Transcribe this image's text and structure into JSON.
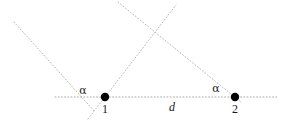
{
  "figure": {
    "canvas": {
      "width": 291,
      "height": 128,
      "background": "#ffffff"
    },
    "style": {
      "dotted_line_color": "#b9b9b9",
      "axis_line_color": "#aaaaaa",
      "point_color": "#000000",
      "label_color": "#1a1a1a",
      "dash_pattern": "1 2.2",
      "line_width": 1,
      "point_radius": 4.2
    },
    "points": [
      {
        "name": "point-1",
        "label": "1",
        "x": 105,
        "y": 97,
        "label_x": 105,
        "label_y": 103
      },
      {
        "name": "point-2",
        "label": "2",
        "x": 235,
        "y": 97,
        "label_x": 235,
        "label_y": 103
      }
    ],
    "angle_labels": [
      {
        "name": "alpha-at-point-1",
        "label": "α",
        "x": 83,
        "y": 85
      },
      {
        "name": "alpha-at-point-2",
        "label": "α",
        "x": 216,
        "y": 83
      }
    ],
    "distance_label": {
      "name": "distance-d",
      "label": "d",
      "x": 172,
      "y": 101
    },
    "axis": {
      "name": "horizontal-baseline",
      "x1": 55,
      "y1": 97,
      "x2": 278,
      "y2": 97
    },
    "rays": [
      {
        "name": "ray-upper-left-to-point-1",
        "x1": 14,
        "y1": 22,
        "x2": 95,
        "y2": 112
      },
      {
        "name": "ray-point-1-through-crossing",
        "x1": 88,
        "y1": 119,
        "x2": 176,
        "y2": 5
      },
      {
        "name": "ray-top-center-to-point-2",
        "x1": 118,
        "y1": 2,
        "x2": 242,
        "y2": 103
      }
    ],
    "crossing": {
      "name": "ray-crossing-point",
      "x": 155,
      "y": 32
    }
  }
}
